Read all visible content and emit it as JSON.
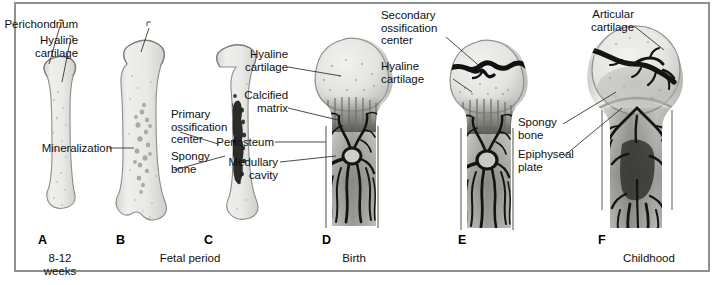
{
  "figure": {
    "background_color": "#ffffff",
    "frame_color": "#8e9092",
    "cartilage_color": "#e8e8e6",
    "bone_color": "#b9b9b7",
    "vessel_color": "#1a1a1a"
  },
  "panels": [
    {
      "letter": "A",
      "caption": "8-12\nweeks"
    },
    {
      "letter": "B",
      "caption": "Fetal period"
    },
    {
      "letter": "C",
      "caption": ""
    },
    {
      "letter": "D",
      "caption": "Birth"
    },
    {
      "letter": "E",
      "caption": ""
    },
    {
      "letter": "F",
      "caption": "Childhood"
    }
  ],
  "labels": {
    "perichondrium": "Perichondrium",
    "hyaline_cartilage_a": "Hyaline\ncartilage",
    "mineralization": "Mineralization",
    "primary_ossification_center": "Primary\nossification\ncenter",
    "spongy_bone_c": "Spongy\nbone",
    "hyaline_cartilage_d": "Hyaline\ncartilage",
    "calcified_matrix": "Calcified\nmatrix",
    "periosteum": "Periosteum",
    "medullary_cavity": "Medullary\ncavity",
    "secondary_ossification_center": "Secondary\nossification\ncenter",
    "hyaline_cartilage_e": "Hyaline\ncartilage",
    "articular_cartilage": "Articular\ncartilage",
    "spongy_bone_f": "Spongy\nbone",
    "epiphyseal_plate": "Epiphyseal\nplate"
  }
}
